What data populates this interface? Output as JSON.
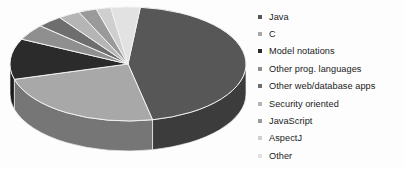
{
  "chart_data": {
    "type": "pie",
    "title": "",
    "subtitle": "",
    "xlabel": "",
    "ylabel": "",
    "legend_position": "right",
    "grid": false,
    "three_d": true,
    "categories": [
      "Java",
      "C",
      "Model notations",
      "Other prog. languages",
      "Other web/database apps",
      "Security oriented",
      "JavaScript",
      "AspectJ",
      "Other"
    ],
    "values": [
      45,
      24,
      11.5,
      4.5,
      3.5,
      3,
      2.5,
      2,
      4
    ],
    "units": "percent",
    "slice_colors": [
      "#575757",
      "#a8a8a8",
      "#2b2b2b",
      "#8f8f8f",
      "#6e6e6e",
      "#b5b5b5",
      "#9a9a9a",
      "#cfcfcf",
      "#e2e2e2"
    ],
    "slice_side_colors": [
      "#3c3c3c",
      "#767676",
      "#1b1b1b",
      "#666666",
      "#4d4d4d",
      "#818181",
      "#6d6d6d",
      "#949494",
      "#a5a5a5"
    ],
    "slice_border_color": "#f2f2f2",
    "background_color": "#fdfdfd"
  },
  "legend": {
    "items": [
      {
        "label": "Java",
        "marker": "legend-swatch-icon",
        "color": "#575757"
      },
      {
        "label": "C",
        "marker": "legend-swatch-icon",
        "color": "#a8a8a8"
      },
      {
        "label": "Model notations",
        "marker": "legend-swatch-icon",
        "color": "#2b2b2b"
      },
      {
        "label": "Other prog. languages",
        "marker": "legend-swatch-icon",
        "color": "#8f8f8f"
      },
      {
        "label": "Other web/database apps",
        "marker": "legend-swatch-icon",
        "color": "#6e6e6e"
      },
      {
        "label": "Security oriented",
        "marker": "legend-swatch-icon",
        "color": "#b5b5b5"
      },
      {
        "label": "JavaScript",
        "marker": "legend-swatch-icon",
        "color": "#9a9a9a"
      },
      {
        "label": "AspectJ",
        "marker": "legend-swatch-icon",
        "color": "#cfcfcf"
      },
      {
        "label": "Other",
        "marker": "legend-swatch-icon",
        "color": "#e2e2e2"
      }
    ]
  }
}
